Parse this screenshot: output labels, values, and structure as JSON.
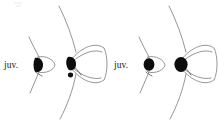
{
  "figure": {
    "title": "",
    "background_color": "#ffffff",
    "width": 219,
    "height": 125,
    "outline_color": "#8a8a8a",
    "spot_color": "#0d0d0d",
    "label_color": "#1b1b1b"
  },
  "specimens": [
    {
      "id": "pair-1-juvenile",
      "label": "juv.",
      "stage": "juvenile",
      "spot_count": 1,
      "size": "small"
    },
    {
      "id": "pair-1-adult",
      "label": "",
      "stage": "adult",
      "spot_count": 2,
      "size": "large"
    },
    {
      "id": "pair-2-juvenile",
      "label": "juv.",
      "stage": "juvenile",
      "spot_count": 1,
      "size": "small"
    },
    {
      "id": "pair-2-adult",
      "label": "",
      "stage": "adult",
      "spot_count": 1,
      "size": "large"
    }
  ],
  "labels": {
    "left_juvenile": "juv.",
    "right_juvenile": "juv."
  }
}
